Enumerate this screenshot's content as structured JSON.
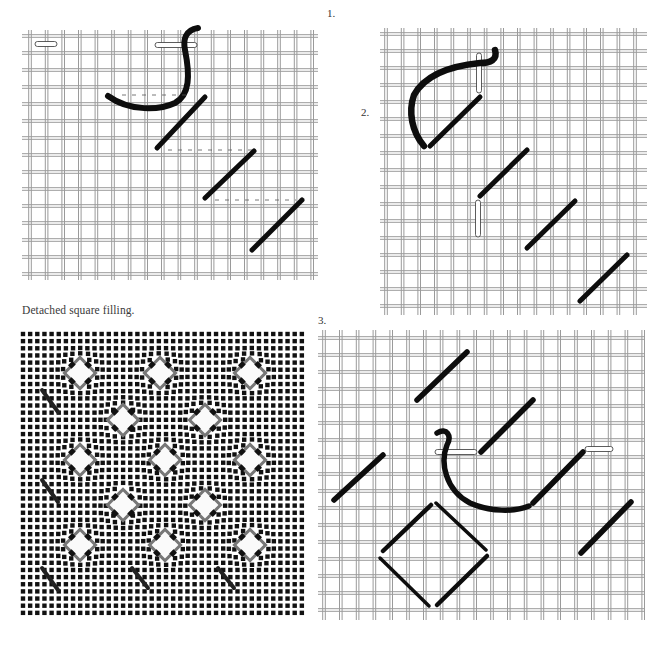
{
  "figure": {
    "caption": "Detached square filling.",
    "steps": [
      {
        "label": "1."
      },
      {
        "label": "2."
      },
      {
        "label": "3."
      }
    ]
  },
  "colors": {
    "canvas_thread": "#9a9a9a",
    "stitch_thread": "#0d0d0d",
    "needle_fill": "#ffffff",
    "background": "#ffffff"
  },
  "diagrams": [
    {
      "name": "step-1",
      "description": "Diagonal stitches worked down a diagonal with needle passing horizontally under threads",
      "stitch_count": 4,
      "needles": 2
    },
    {
      "name": "step-2",
      "description": "Diagonal stitches continued with needle passing vertically",
      "stitch_count": 4,
      "needles": 2
    },
    {
      "name": "step-3",
      "description": "Completed square outline with further diagonal stitches",
      "stitch_count": 10,
      "needles": 2
    }
  ],
  "sampler": {
    "name": "detached-square-filling-sample",
    "rows": 5,
    "squares_per_row": [
      3,
      2,
      3,
      2,
      3
    ]
  }
}
